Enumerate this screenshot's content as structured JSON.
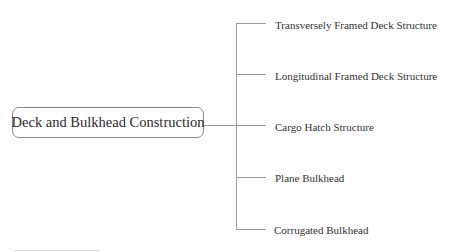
{
  "root": {
    "label": "Deck and Bulkhead Construction"
  },
  "branches": [
    {
      "label": "Transversely Framed Deck Structure",
      "y": 24
    },
    {
      "label": "Longitudinal Framed Deck Structure",
      "y": 75
    },
    {
      "label": "Cargo Hatch Structure",
      "y": 126
    },
    {
      "label": "Plane Bulkhead",
      "y": 177
    },
    {
      "label": "Corrugated Bulkhead",
      "y": 229
    }
  ],
  "colors": {
    "line": "#9a9a9a",
    "text": "#333333",
    "border": "#8a8a8a"
  }
}
